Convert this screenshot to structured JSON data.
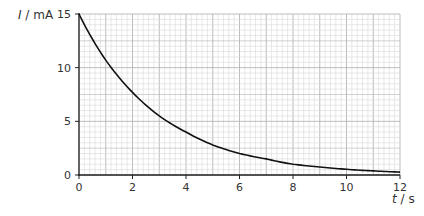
{
  "chart_data": {
    "type": "line",
    "title": "",
    "xlabel": "t / s",
    "ylabel": "I / mA",
    "xlabel_var": "t",
    "xlabel_unit": "s",
    "ylabel_var": "I",
    "ylabel_unit": "mA",
    "xlim": [
      0,
      12
    ],
    "ylim": [
      0,
      15
    ],
    "x_ticks": [
      0,
      2,
      4,
      6,
      8,
      10,
      12
    ],
    "y_ticks": [
      0,
      5,
      10,
      15
    ],
    "grid": true,
    "grid_minor_x": 0.2,
    "grid_minor_y": 0.5,
    "legend": null,
    "series": [
      {
        "name": "current",
        "x": [
          0,
          1,
          2,
          3,
          4,
          5,
          6,
          7,
          8,
          9,
          10,
          11,
          12
        ],
        "values": [
          15.0,
          10.7,
          7.7,
          5.5,
          4.0,
          2.8,
          2.0,
          1.5,
          1.0,
          0.75,
          0.53,
          0.38,
          0.27
        ]
      }
    ],
    "colors": {
      "curve": "#111111",
      "axis": "#222222",
      "grid_minor": "#d9d9d9",
      "grid_major": "#b5b5b5"
    }
  }
}
